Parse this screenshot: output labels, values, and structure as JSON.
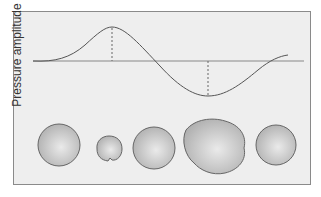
{
  "diagram": {
    "y_axis_label": "Pressure amplitude",
    "wave": {
      "type": "sinusoidal pressure wave",
      "phases": [
        "rest",
        "compression peak",
        "zero crossing",
        "rarefaction trough",
        "return"
      ]
    },
    "bubbles": [
      {
        "state": "rest",
        "shape": "sphere",
        "relative_size": "medium"
      },
      {
        "state": "compression",
        "shape": "sphere",
        "relative_size": "small"
      },
      {
        "state": "equilibrium",
        "shape": "sphere",
        "relative_size": "medium"
      },
      {
        "state": "rarefaction",
        "shape": "irregular",
        "relative_size": "large"
      },
      {
        "state": "rest",
        "shape": "sphere",
        "relative_size": "medium"
      }
    ],
    "colors": {
      "background": "#eeeeee",
      "frame": "#8a8a8a",
      "curve": "#555555",
      "baseline": "#888888",
      "bubble_fill": "#bdbdbd",
      "bubble_stroke": "#666666"
    }
  }
}
